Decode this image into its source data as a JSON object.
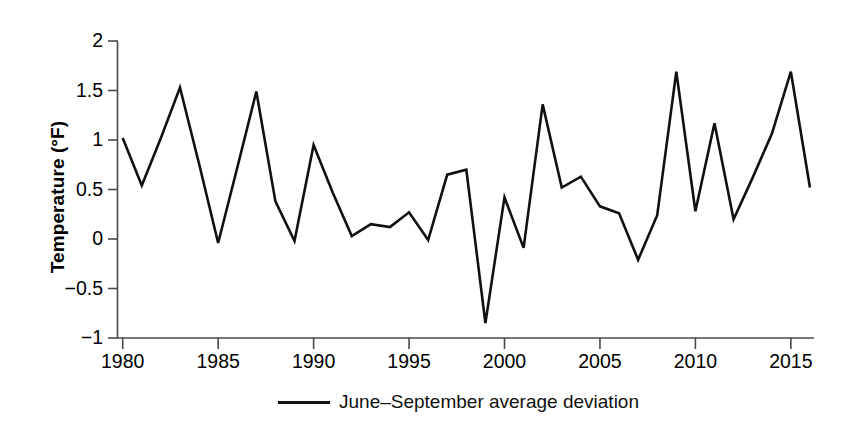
{
  "chart_data": {
    "type": "line",
    "title": "",
    "xlabel": "",
    "ylabel": "Temperature (°F)",
    "xlim": [
      1980,
      2016
    ],
    "ylim": [
      -1,
      2
    ],
    "yticks": [
      -1,
      -0.5,
      0,
      0.5,
      1,
      1.5,
      2
    ],
    "ytick_labels": [
      "−1",
      "−0.5",
      "0",
      "0.5",
      "1",
      "1.5",
      "2"
    ],
    "xticks": [
      1980,
      1985,
      1990,
      1995,
      2000,
      2005,
      2010,
      2015
    ],
    "xtick_labels": [
      "1980",
      "1985",
      "1990",
      "1995",
      "2000",
      "2005",
      "2010",
      "2015"
    ],
    "grid": false,
    "legend_position": "bottom-center",
    "series": [
      {
        "name": "June–September average deviation",
        "color": "#111111",
        "x": [
          1980,
          1981,
          1982,
          1983,
          1984,
          1985,
          1986,
          1987,
          1988,
          1989,
          1990,
          1991,
          1992,
          1993,
          1994,
          1995,
          1996,
          1997,
          1998,
          1999,
          2000,
          2001,
          2002,
          2003,
          2004,
          2005,
          2006,
          2007,
          2008,
          2009,
          2010,
          2011,
          2012,
          2013,
          2014,
          2015,
          2016
        ],
        "values": [
          1.02,
          0.54,
          1.02,
          1.53,
          0.76,
          -0.04,
          0.72,
          1.49,
          0.38,
          -0.02,
          0.95,
          0.47,
          0.03,
          0.15,
          0.12,
          0.27,
          -0.01,
          0.65,
          0.7,
          -0.85,
          0.42,
          -0.09,
          1.36,
          0.52,
          0.63,
          0.33,
          0.26,
          -0.21,
          0.24,
          1.69,
          0.28,
          1.17,
          0.2,
          0.62,
          1.06,
          1.69,
          0.52
        ]
      }
    ]
  },
  "legend": {
    "items": [
      {
        "label": "June–September average deviation"
      }
    ]
  },
  "axes": {
    "y_title": "Temperature (°F)"
  }
}
